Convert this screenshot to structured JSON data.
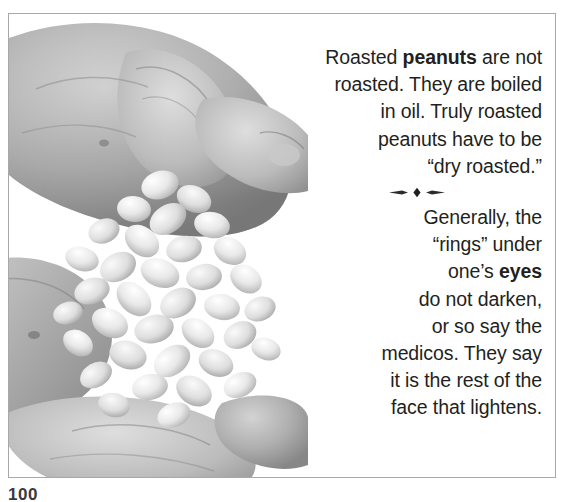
{
  "page": {
    "folio": "100",
    "background_color": "#ffffff",
    "frame_color": "#a8a8a8",
    "text_color": "#231f20"
  },
  "photo": {
    "alt": "Two cupped hands holding a pile of shelled raw peanuts",
    "treatment": "grayscale halftone photograph"
  },
  "text": {
    "paragraph_1": {
      "lines": [
        "Roasted ",
        "peanuts",
        " are not\nroasted. They are boiled\nin oil. Truly roasted\npeanuts have to be\n“dry roasted.”"
      ],
      "plain": "Roasted peanuts are not roasted. They are boiled in oil. Truly roasted peanuts have to be “dry roasted.”",
      "lead": "Roasted ",
      "bold": "peanuts",
      "tail": " are not\nroasted. They are boiled\nin oil. Truly roasted\npeanuts have to be\n“dry roasted.”"
    },
    "paragraph_2": {
      "plain": "Generally, the “rings” under one’s eyes do not darken, or so say the medicos. They say it is the rest of the face that lightens.",
      "lead": "Generally, the\n“rings” under\none’s ",
      "bold": "eyes",
      "tail": "\ndo not darken,\nor so say the\nmedicos. They say\nit is the rest of the\nface that lightens."
    }
  },
  "divider": {
    "name": "diamond-ornament-divider",
    "glyph": "—◆—"
  }
}
